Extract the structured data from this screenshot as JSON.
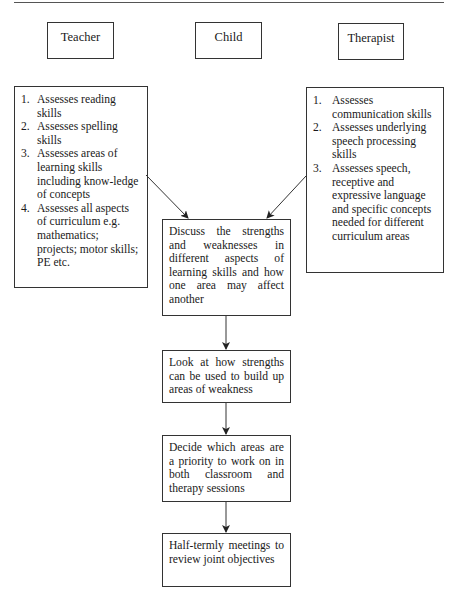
{
  "roles": {
    "teacher": "Teacher",
    "child": "Child",
    "therapist": "Therapist"
  },
  "teacher_list": [
    {
      "num": "1.",
      "text": "Assesses reading skills"
    },
    {
      "num": "2.",
      "text": "Assesses spelling skills"
    },
    {
      "num": "3.",
      "text": "Assesses areas of learning skills including know-ledge of concepts"
    },
    {
      "num": "4.",
      "text": "Assesses all aspects of curriculum e.g. mathematics; projects; motor skills; PE etc."
    }
  ],
  "therapist_list": [
    {
      "num": "1.",
      "text": "Assesses communication skills"
    },
    {
      "num": "2.",
      "text": "Assesses underlying speech processing skills"
    },
    {
      "num": "3.",
      "text": "Assesses speech, receptive and expressive language and specific concepts needed for different curriculum areas"
    }
  ],
  "flow_steps": [
    "Discuss the strengths and weaknesses in different aspects of learning skills and how one area may affect another",
    "Look at how strengths can be used to build up areas of weakness",
    "Decide which areas are a priority to work on in both classroom and therapy sessions",
    "Half-termly meetings to review joint objectives"
  ]
}
